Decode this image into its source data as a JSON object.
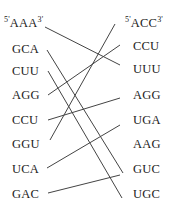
{
  "diagram": {
    "type": "codon-matching",
    "left_column": {
      "first_prime_left": "5'",
      "first_prime_right": "3'",
      "items": [
        "AAA",
        "GCA",
        "CUU",
        "AGG",
        "CCU",
        "GGU",
        "UCA",
        "GAC"
      ]
    },
    "right_column": {
      "first_prime_left": "5'",
      "first_prime_right": "3'",
      "items": [
        "ACC",
        "CCU",
        "UUU",
        "AGG",
        "UGA",
        "AAG",
        "GUC",
        "UGC"
      ]
    },
    "connections": [
      {
        "from": "AAA",
        "to": "UUU",
        "x1": 45,
        "y1": 27,
        "x2": 120,
        "y2": 65
      },
      {
        "from": "GCA",
        "to": "AAG",
        "x1": 47,
        "y1": 50,
        "x2": 123,
        "y2": 173
      },
      {
        "from": "CUU",
        "to": "UGC",
        "x1": 48,
        "y1": 71,
        "x2": 122,
        "y2": 198
      },
      {
        "from": "AGG",
        "to": "CCU",
        "x1": 48,
        "y1": 95,
        "x2": 120,
        "y2": 45
      },
      {
        "from": "CCU",
        "to": "AGG",
        "x1": 48,
        "y1": 120,
        "x2": 120,
        "y2": 98
      },
      {
        "from": "GGU",
        "to": "ACC",
        "x1": 50,
        "y1": 140,
        "x2": 115,
        "y2": 24
      },
      {
        "from": "UCA",
        "to": "UGA",
        "x1": 47,
        "y1": 168,
        "x2": 120,
        "y2": 125
      },
      {
        "from": "GAC",
        "to": "GUC",
        "x1": 48,
        "y1": 193,
        "x2": 120,
        "y2": 175
      }
    ],
    "line_color": "#444444"
  }
}
